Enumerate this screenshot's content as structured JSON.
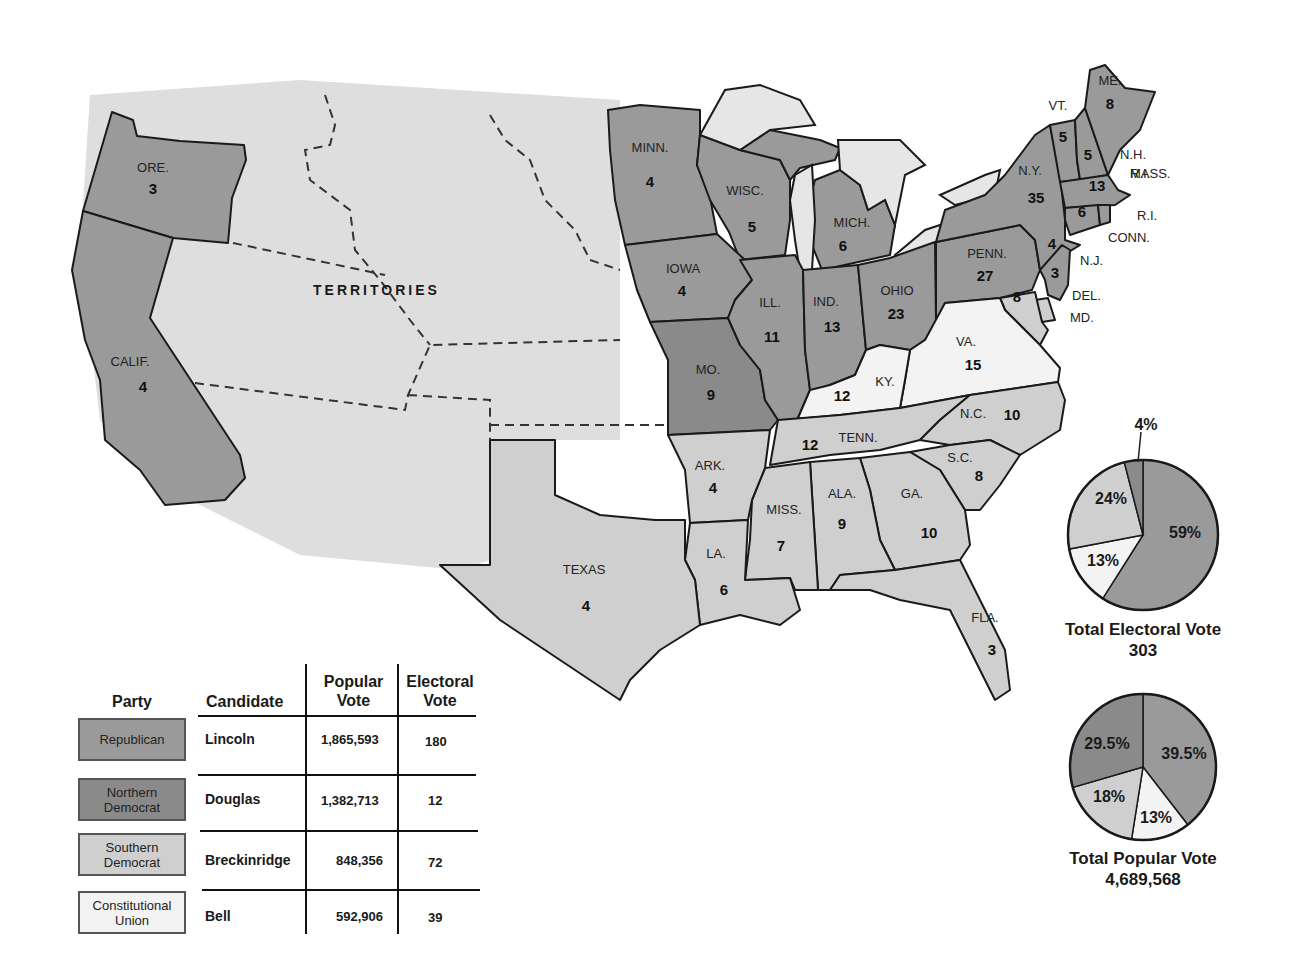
{
  "map": {
    "territories_label": "TERRITORIES",
    "colors": {
      "republican": "#9a9a9a",
      "northern_democrat": "#8a8a8a",
      "southern_democrat": "#cfcfcf",
      "constitutional_union": "#f3f3f3"
    },
    "states": [
      {
        "abbr": "ORE.",
        "votes": "3",
        "party": "Republican"
      },
      {
        "abbr": "CALIF.",
        "votes": "4",
        "party": "Republican"
      },
      {
        "abbr": "MINN.",
        "votes": "4",
        "party": "Republican"
      },
      {
        "abbr": "WISC.",
        "votes": "5",
        "party": "Republican"
      },
      {
        "abbr": "MICH.",
        "votes": "6",
        "party": "Republican"
      },
      {
        "abbr": "IOWA",
        "votes": "4",
        "party": "Republican"
      },
      {
        "abbr": "ILL.",
        "votes": "11",
        "party": "Republican"
      },
      {
        "abbr": "IND.",
        "votes": "13",
        "party": "Republican"
      },
      {
        "abbr": "OHIO",
        "votes": "23",
        "party": "Republican"
      },
      {
        "abbr": "PENN.",
        "votes": "27",
        "party": "Republican"
      },
      {
        "abbr": "N.Y.",
        "votes": "35",
        "party": "Republican"
      },
      {
        "abbr": "MO.",
        "votes": "9",
        "party": "Northern Democrat"
      },
      {
        "abbr": "KY.",
        "votes": "12",
        "party": "Constitutional Union"
      },
      {
        "abbr": "VA.",
        "votes": "15",
        "party": "Constitutional Union"
      },
      {
        "abbr": "TENN.",
        "votes": "12",
        "party": "Constitutional Union"
      },
      {
        "abbr": "N.C.",
        "votes": "10",
        "party": "Southern Democrat"
      },
      {
        "abbr": "S.C.",
        "votes": "8",
        "party": "Southern Democrat"
      },
      {
        "abbr": "GA.",
        "votes": "10",
        "party": "Southern Democrat"
      },
      {
        "abbr": "ALA.",
        "votes": "9",
        "party": "Southern Democrat"
      },
      {
        "abbr": "MISS.",
        "votes": "7",
        "party": "Southern Democrat"
      },
      {
        "abbr": "LA.",
        "votes": "6",
        "party": "Southern Democrat"
      },
      {
        "abbr": "ARK.",
        "votes": "4",
        "party": "Southern Democrat"
      },
      {
        "abbr": "TEXAS",
        "votes": "4",
        "party": "Southern Democrat"
      },
      {
        "abbr": "FLA.",
        "votes": "3",
        "party": "Southern Democrat"
      },
      {
        "abbr": "ME.",
        "votes": "8",
        "party": "Republican"
      },
      {
        "abbr": "VT.",
        "votes": "5",
        "party": "Republican"
      },
      {
        "abbr": "N.H.",
        "votes": "5",
        "party": "Republican"
      },
      {
        "abbr": "MASS.",
        "votes": "13",
        "party": "Republican"
      },
      {
        "abbr": "R.I.",
        "votes": "4",
        "party": "Republican"
      },
      {
        "abbr": "CONN.",
        "votes": "6",
        "party": "Republican"
      },
      {
        "abbr": "N.J.",
        "votes": "4",
        "party": "Republican"
      },
      {
        "abbr": "DEL.",
        "votes": "3",
        "party": "Southern Democrat"
      },
      {
        "abbr": "MD.",
        "votes": "8",
        "party": "Southern Democrat"
      }
    ]
  },
  "legend": {
    "headers": {
      "party": "Party",
      "candidate": "Candidate",
      "popular_vote": "Popular Vote",
      "popular_vote_l1": "Popular",
      "popular_vote_l2": "Vote",
      "electoral_vote_l1": "Electoral",
      "electoral_vote_l2": "Vote"
    },
    "rows": [
      {
        "party_l1": "Republican",
        "party_l2": "",
        "candidate": "Lincoln",
        "popular": "1,865,593",
        "electoral": "180"
      },
      {
        "party_l1": "Northern",
        "party_l2": "Democrat",
        "candidate": "Douglas",
        "popular": "1,382,713",
        "electoral": "12"
      },
      {
        "party_l1": "Southern",
        "party_l2": "Democrat",
        "candidate": "Breckinridge",
        "popular": "848,356",
        "electoral": "72"
      },
      {
        "party_l1": "Constitutional",
        "party_l2": "Union",
        "candidate": "Bell",
        "popular": "592,906",
        "electoral": "39"
      }
    ]
  },
  "pies": {
    "electoral": {
      "title": "Total Electoral Vote",
      "total": "303",
      "slices": [
        {
          "party": "Republican",
          "label": "59%",
          "value": 59
        },
        {
          "party": "Constitutional Union",
          "label": "13%",
          "value": 13
        },
        {
          "party": "Southern Democrat",
          "label": "24%",
          "value": 24
        },
        {
          "party": "Northern Democrat",
          "label": "4%",
          "value": 4
        }
      ]
    },
    "popular": {
      "title": "Total Popular Vote",
      "total": "4,689,568",
      "slices": [
        {
          "party": "Republican",
          "label": "39.5%",
          "value": 39.5
        },
        {
          "party": "Constitutional Union",
          "label": "13%",
          "value": 13
        },
        {
          "party": "Southern Democrat",
          "label": "18%",
          "value": 18
        },
        {
          "party": "Northern Democrat",
          "label": "29.5%",
          "value": 29.5
        }
      ]
    }
  },
  "chart_data": [
    {
      "type": "pie",
      "title": "Total Electoral Vote",
      "subtitle": "303",
      "categories": [
        "Republican (Lincoln)",
        "Constitutional Union (Bell)",
        "Southern Democrat (Breckinridge)",
        "Northern Democrat (Douglas)"
      ],
      "values": [
        59,
        13,
        24,
        4
      ]
    },
    {
      "type": "pie",
      "title": "Total Popular Vote",
      "subtitle": "4,689,568",
      "categories": [
        "Republican (Lincoln)",
        "Constitutional Union (Bell)",
        "Southern Democrat (Breckinridge)",
        "Northern Democrat (Douglas)"
      ],
      "values": [
        39.5,
        13,
        18,
        29.5
      ]
    },
    {
      "type": "table",
      "title": "1860 Election Results",
      "columns": [
        "Party",
        "Candidate",
        "Popular Vote",
        "Electoral Vote"
      ],
      "rows": [
        [
          "Republican",
          "Lincoln",
          1865593,
          180
        ],
        [
          "Northern Democrat",
          "Douglas",
          1382713,
          12
        ],
        [
          "Southern Democrat",
          "Breckinridge",
          848356,
          72
        ],
        [
          "Constitutional Union",
          "Bell",
          592906,
          39
        ]
      ]
    }
  ]
}
